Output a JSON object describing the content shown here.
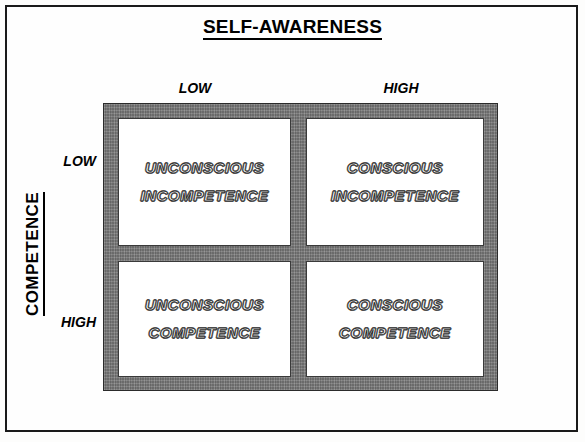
{
  "title": "SELF-AWARENESS",
  "axes": {
    "x_title": "SELF-AWARENESS",
    "y_title": "COMPETENCE",
    "x_labels": [
      "LOW",
      "HIGH"
    ],
    "y_labels": [
      "LOW",
      "HIGH"
    ]
  },
  "columns": {
    "low": "LOW",
    "high": "HIGH"
  },
  "rows": {
    "low": "LOW",
    "high": "HIGH"
  },
  "quadrants": [
    {
      "id": "unconscious-incompetence",
      "row": "LOW",
      "column": "LOW",
      "line1": "UNCONSCIOUS",
      "line2": "INCOMPETENCE"
    },
    {
      "id": "conscious-incompetence",
      "row": "LOW",
      "column": "HIGH",
      "line1": "CONSCIOUS",
      "line2": "INCOMPETENCE"
    },
    {
      "id": "unconscious-competence",
      "row": "HIGH",
      "column": "LOW",
      "line1": "UNCONSCIOUS",
      "line2": "COMPETENCE"
    },
    {
      "id": "conscious-competence",
      "row": "HIGH",
      "column": "HIGH",
      "line1": "CONSCIOUS",
      "line2": "COMPETENCE"
    }
  ],
  "colors": {
    "page_background": "#fefefe",
    "page_border": "#1a1a1a",
    "matrix_frame": "#7a7a7a",
    "quadrant_fill": "#ffffff",
    "text": "#000000"
  }
}
